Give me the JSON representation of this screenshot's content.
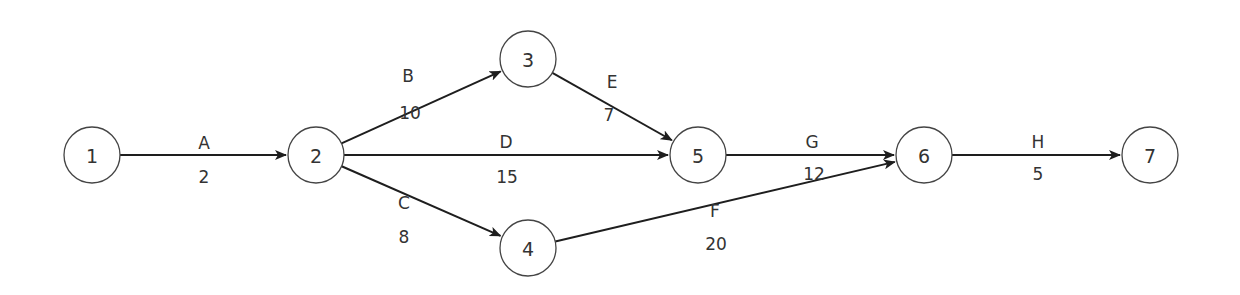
{
  "diagram": {
    "type": "activity-on-arrow network",
    "nodes": [
      {
        "id": "1",
        "label": "1",
        "x": 92,
        "y": 155
      },
      {
        "id": "2",
        "label": "2",
        "x": 316,
        "y": 155
      },
      {
        "id": "3",
        "label": "3",
        "x": 528,
        "y": 59
      },
      {
        "id": "4",
        "label": "4",
        "x": 528,
        "y": 248
      },
      {
        "id": "5",
        "label": "5",
        "x": 698,
        "y": 155
      },
      {
        "id": "6",
        "label": "6",
        "x": 924,
        "y": 155
      },
      {
        "id": "7",
        "label": "7",
        "x": 1150,
        "y": 155
      }
    ],
    "edges": [
      {
        "activity": "A",
        "duration": "2",
        "from": "1",
        "to": "2",
        "name_pos": [
          204,
          149
        ],
        "dur_pos": [
          204,
          183
        ]
      },
      {
        "activity": "B",
        "duration": "10",
        "from": "2",
        "to": "3",
        "name_pos": [
          408,
          82
        ],
        "dur_pos": [
          410,
          119
        ]
      },
      {
        "activity": "D",
        "duration": "15",
        "from": "2",
        "to": "5",
        "name_pos": [
          506,
          148
        ],
        "dur_pos": [
          507,
          183
        ]
      },
      {
        "activity": "C",
        "duration": "8",
        "from": "2",
        "to": "4",
        "name_pos": [
          404,
          209
        ],
        "dur_pos": [
          404,
          243
        ]
      },
      {
        "activity": "E",
        "duration": "7",
        "from": "3",
        "to": "5",
        "name_pos": [
          612,
          88
        ],
        "dur_pos": [
          609,
          121
        ]
      },
      {
        "activity": "G",
        "duration": "12",
        "from": "5",
        "to": "6",
        "name_pos": [
          812,
          148
        ],
        "dur_pos": [
          814,
          180
        ]
      },
      {
        "activity": "F",
        "duration": "20",
        "from": "4",
        "to": "6",
        "name_pos": [
          715,
          217
        ],
        "dur_pos": [
          716,
          250
        ]
      },
      {
        "activity": "H",
        "duration": "5",
        "from": "6",
        "to": "7",
        "name_pos": [
          1038,
          148
        ],
        "dur_pos": [
          1038,
          180
        ]
      }
    ],
    "style": {
      "node_radius": 28,
      "node_stroke": "#444444",
      "edge_color": "#1e1e1e",
      "text_color": "#333333"
    }
  }
}
